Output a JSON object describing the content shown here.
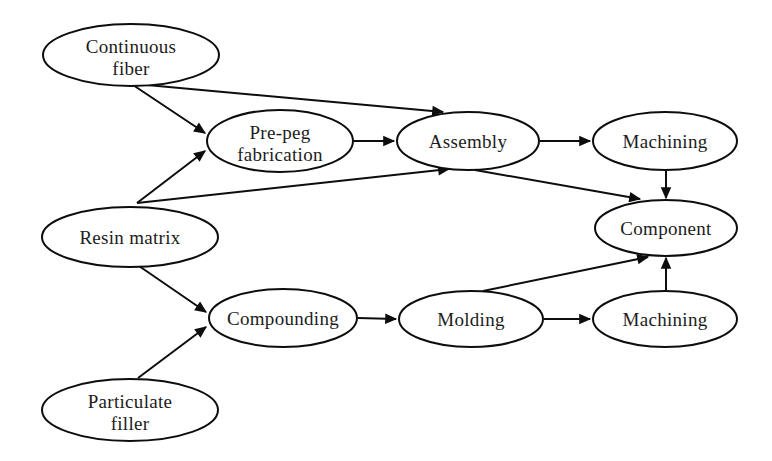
{
  "diagram": {
    "width": 772,
    "height": 461,
    "background": "#ffffff",
    "stroke_color": "#0d0d0d",
    "text_color": "#1c1c1c",
    "font_size": 19,
    "line_width": 2,
    "nodes": [
      {
        "id": "continuous-fiber",
        "label": [
          "Continuous",
          "fiber"
        ],
        "cx": 131,
        "cy": 55,
        "rx": 88,
        "ry": 31
      },
      {
        "id": "pre-peg-fabrication",
        "label": [
          "Pre-peg",
          "fabrication"
        ],
        "cx": 280,
        "cy": 141,
        "rx": 73,
        "ry": 31
      },
      {
        "id": "assembly",
        "label": [
          "Assembly"
        ],
        "cx": 468,
        "cy": 141,
        "rx": 71,
        "ry": 29
      },
      {
        "id": "machining-top",
        "label": [
          "Machining"
        ],
        "cx": 665,
        "cy": 141,
        "rx": 72,
        "ry": 29
      },
      {
        "id": "resin-matrix",
        "label": [
          "Resin matrix"
        ],
        "cx": 130,
        "cy": 237,
        "rx": 88,
        "ry": 30
      },
      {
        "id": "component",
        "label": [
          "Component"
        ],
        "cx": 666,
        "cy": 228,
        "rx": 71,
        "ry": 28
      },
      {
        "id": "compounding",
        "label": [
          "Compounding"
        ],
        "cx": 283,
        "cy": 318,
        "rx": 74,
        "ry": 29
      },
      {
        "id": "molding",
        "label": [
          "Molding"
        ],
        "cx": 471,
        "cy": 319,
        "rx": 72,
        "ry": 28
      },
      {
        "id": "machining-bottom",
        "label": [
          "Machining"
        ],
        "cx": 665,
        "cy": 319,
        "rx": 72,
        "ry": 28
      },
      {
        "id": "particulate-filler",
        "label": [
          "Particulate",
          "filler"
        ],
        "cx": 130,
        "cy": 410,
        "rx": 88,
        "ry": 31
      }
    ],
    "edges": [
      {
        "from": "continuous-fiber",
        "to": "pre-peg-fabrication",
        "x1": 133,
        "y1": 85,
        "x2": 205,
        "y2": 133
      },
      {
        "from": "continuous-fiber",
        "to": "assembly",
        "x1": 136,
        "y1": 84,
        "x2": 443,
        "y2": 112
      },
      {
        "from": "resin-matrix",
        "to": "pre-peg-fabrication",
        "x1": 137,
        "y1": 203,
        "x2": 205,
        "y2": 151
      },
      {
        "from": "resin-matrix",
        "to": "assembly",
        "x1": 137,
        "y1": 203,
        "x2": 449,
        "y2": 169
      },
      {
        "from": "pre-peg-fabrication",
        "to": "assembly",
        "x1": 354,
        "y1": 141,
        "x2": 394,
        "y2": 141
      },
      {
        "from": "assembly",
        "to": "machining-top",
        "x1": 540,
        "y1": 141,
        "x2": 590,
        "y2": 141
      },
      {
        "from": "machining-top",
        "to": "component",
        "x1": 666,
        "y1": 170,
        "x2": 666,
        "y2": 198
      },
      {
        "from": "assembly",
        "to": "component",
        "x1": 475,
        "y1": 170,
        "x2": 640,
        "y2": 199
      },
      {
        "from": "resin-matrix",
        "to": "compounding",
        "x1": 139,
        "y1": 266,
        "x2": 206,
        "y2": 312
      },
      {
        "from": "particulate-filler",
        "to": "compounding",
        "x1": 138,
        "y1": 378,
        "x2": 206,
        "y2": 327
      },
      {
        "from": "compounding",
        "to": "molding",
        "x1": 358,
        "y1": 318,
        "x2": 396,
        "y2": 319
      },
      {
        "from": "molding",
        "to": "machining-bottom",
        "x1": 544,
        "y1": 319,
        "x2": 590,
        "y2": 319
      },
      {
        "from": "machining-bottom",
        "to": "component",
        "x1": 666,
        "y1": 290,
        "x2": 666,
        "y2": 258
      },
      {
        "from": "molding",
        "to": "component",
        "x1": 483,
        "y1": 291,
        "x2": 648,
        "y2": 257
      }
    ]
  }
}
